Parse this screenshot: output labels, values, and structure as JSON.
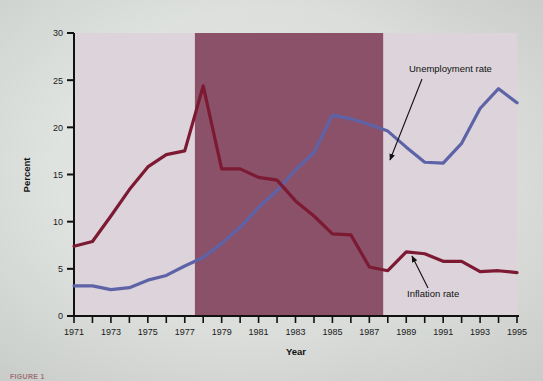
{
  "figure": {
    "caption": "FIGURE 1"
  },
  "chart_data": {
    "type": "line",
    "title": "",
    "xlabel": "Year",
    "ylabel": "Percent",
    "xlim": [
      1971,
      1995
    ],
    "ylim": [
      0,
      30
    ],
    "yticks": [
      0,
      5,
      10,
      15,
      20,
      25,
      30
    ],
    "xticks": [
      1971,
      1972,
      1973,
      1974,
      1975,
      1976,
      1977,
      1978,
      1979,
      1980,
      1981,
      1982,
      1983,
      1984,
      1985,
      1986,
      1987,
      1988,
      1989,
      1990,
      1991,
      1992,
      1993,
      1994,
      1995
    ],
    "xtick_labels_shown": [
      "1971",
      "1973",
      "1975",
      "1977",
      "1979",
      "1981",
      "1983",
      "1985",
      "1987",
      "1989",
      "1991",
      "1993",
      "1995"
    ],
    "grid": false,
    "legend_position": "inline-annotations",
    "plot_background": "#dcd4da",
    "shaded_region": {
      "label": "",
      "x_start": 1977.55,
      "x_end": 1987.75,
      "color": "#8a5168"
    },
    "x": [
      1971,
      1972,
      1973,
      1974,
      1975,
      1976,
      1977,
      1978,
      1979,
      1980,
      1981,
      1982,
      1983,
      1984,
      1985,
      1986,
      1987,
      1988,
      1989,
      1990,
      1991,
      1992,
      1993,
      1994,
      1995
    ],
    "series": [
      {
        "name": "Unemployment rate",
        "color": "#5e63a8",
        "values": [
          3.2,
          3.2,
          2.8,
          3.0,
          3.8,
          4.3,
          5.3,
          6.2,
          7.7,
          9.4,
          11.5,
          13.3,
          15.5,
          17.3,
          21.3,
          20.9,
          20.3,
          19.6,
          17.9,
          16.3,
          16.2,
          18.3,
          22.0,
          24.1,
          22.6
        ]
      },
      {
        "name": "Inflation rate",
        "color": "#7d1a33",
        "values": [
          7.4,
          7.9,
          10.6,
          13.4,
          15.8,
          17.1,
          17.5,
          24.4,
          15.6,
          15.6,
          14.7,
          14.4,
          12.2,
          10.6,
          8.7,
          8.6,
          5.2,
          4.8,
          6.8,
          6.6,
          5.8,
          5.8,
          4.7,
          4.8,
          4.6
        ]
      }
    ],
    "annotations": [
      {
        "text": "Unemployment rate",
        "text_x": 409,
        "text_y": 72,
        "arrow_from_x": 422,
        "arrow_from_y": 79,
        "arrow_to_x": 390,
        "arrow_to_y": 160
      },
      {
        "text": "Inflation rate",
        "text_x": 407,
        "text_y": 297,
        "arrow_from_x": 428,
        "arrow_from_y": 288,
        "arrow_to_x": 412,
        "arrow_to_y": 256
      }
    ]
  }
}
